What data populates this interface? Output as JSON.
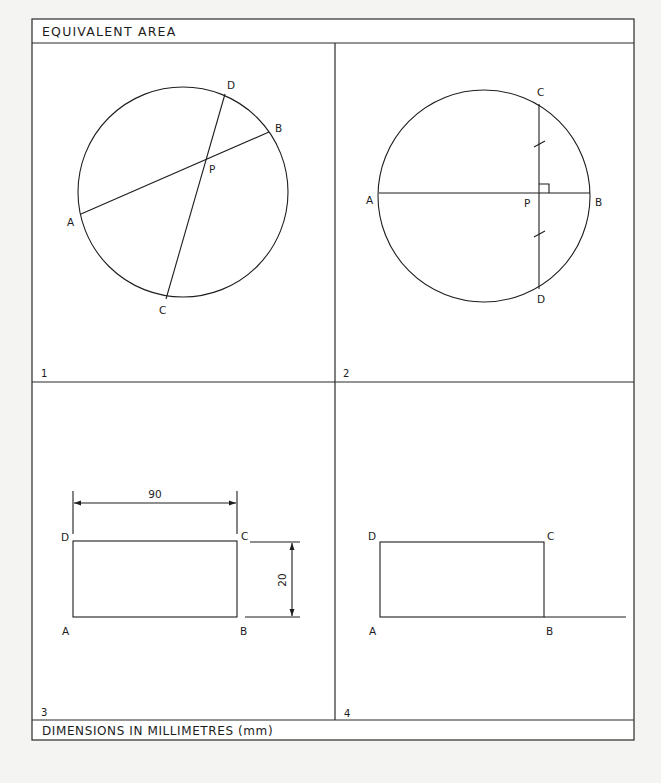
{
  "header": {
    "title": "EQUIVALENT AREA"
  },
  "footer": {
    "note": "DIMENSIONS IN MILLIMETRES (mm)"
  },
  "panels": [
    {
      "number": "1",
      "circle": {
        "cx": 183,
        "cy": 192,
        "r": 105
      },
      "points": {
        "A": {
          "label": "A",
          "x": 81,
          "y": 214
        },
        "B": {
          "label": "B",
          "x": 269,
          "y": 132
        },
        "C": {
          "label": "C",
          "x": 166,
          "y": 299
        },
        "D": {
          "label": "D",
          "x": 225,
          "y": 94
        },
        "P": {
          "label": "P",
          "x": 206,
          "y": 160
        }
      },
      "chords": [
        "AB",
        "CD"
      ]
    },
    {
      "number": "2",
      "circle": {
        "cx": 484,
        "cy": 196,
        "r": 106
      },
      "points": {
        "A": {
          "label": "A",
          "x": 379,
          "y": 193
        },
        "B": {
          "label": "B",
          "x": 590,
          "y": 193
        },
        "C": {
          "label": "C",
          "x": 539,
          "y": 104
        },
        "D": {
          "label": "D",
          "x": 539,
          "y": 289
        },
        "P": {
          "label": "P",
          "x": 539,
          "y": 193
        }
      },
      "chords": [
        "AB",
        "CD"
      ],
      "annotations": [
        "right-angle at P",
        "equal-length ticks on PC and PD"
      ]
    },
    {
      "number": "3",
      "rectangle": {
        "A": {
          "label": "A"
        },
        "B": {
          "label": "B"
        },
        "C": {
          "label": "C"
        },
        "D": {
          "label": "D"
        }
      },
      "dimensions": {
        "width": "90",
        "height": "20"
      }
    },
    {
      "number": "4",
      "rectangle": {
        "A": {
          "label": "A"
        },
        "B": {
          "label": "B"
        },
        "C": {
          "label": "C"
        },
        "D": {
          "label": "D"
        }
      },
      "note": "base line AB extended beyond B"
    }
  ]
}
